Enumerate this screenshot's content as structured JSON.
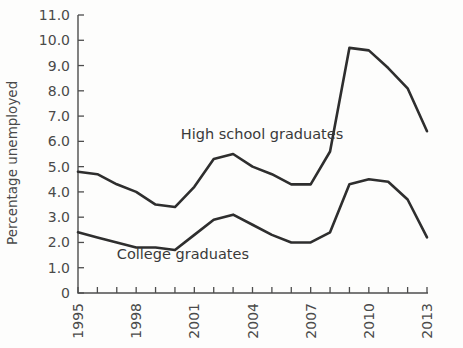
{
  "chart_data": {
    "type": "line",
    "title": "",
    "xlabel": "",
    "ylabel": "Percentage unemployed",
    "xlim": [
      1995,
      2013
    ],
    "ylim": [
      0,
      11
    ],
    "yticks": [
      0,
      1.0,
      2.0,
      3.0,
      4.0,
      5.0,
      6.0,
      7.0,
      8.0,
      9.0,
      10.0,
      11.0
    ],
    "ytick_labels": [
      "0",
      "1.0",
      "2.0",
      "3.0",
      "4.0",
      "5.0",
      "6.0",
      "7.0",
      "8.0",
      "9.0",
      "10.0",
      "11.0"
    ],
    "x": [
      1995,
      1996,
      1997,
      1998,
      1999,
      2000,
      2001,
      2002,
      2003,
      2004,
      2005,
      2006,
      2007,
      2008,
      2009,
      2010,
      2011,
      2012,
      2013
    ],
    "xtick_labels_shown": [
      "1995",
      "1998",
      "2001",
      "2004",
      "2007",
      "2010",
      "2013"
    ],
    "xtick_label_years": [
      1995,
      1998,
      2001,
      2004,
      2007,
      2010,
      2013
    ],
    "grid": false,
    "legend_position": "inline-annotations",
    "series": [
      {
        "name": "High school graduates",
        "label_x": 2000.3,
        "label_y": 6.1,
        "values": [
          4.8,
          4.7,
          4.3,
          4.0,
          3.5,
          3.4,
          4.2,
          5.3,
          5.5,
          5.0,
          4.7,
          4.3,
          4.3,
          5.6,
          9.7,
          9.6,
          8.9,
          8.1,
          6.4
        ]
      },
      {
        "name": "College graduates",
        "label_x": 1997.0,
        "label_y": 1.35,
        "values": [
          2.4,
          2.2,
          2.0,
          1.8,
          1.8,
          1.7,
          2.3,
          2.9,
          3.1,
          2.7,
          2.3,
          2.0,
          2.0,
          2.4,
          4.3,
          4.5,
          4.4,
          3.7,
          2.2
        ]
      }
    ]
  },
  "geometry": {
    "plot_left": 78,
    "plot_right": 427,
    "y_zero_px": 293,
    "y_top_px": 15,
    "y_top_value": 11,
    "tick_len": 6,
    "xtick_len": 6
  },
  "colors": {
    "background": "#fdfdfc",
    "axis": "#4d4d4d",
    "line": "#2e2e2e",
    "text": "#4a4a4a"
  }
}
